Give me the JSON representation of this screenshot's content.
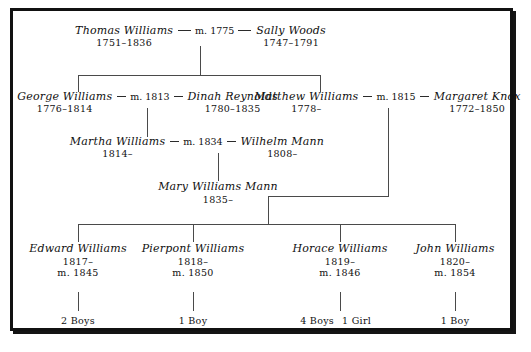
{
  "diagram": {
    "type": "genealogy-family-tree",
    "generations": [
      {
        "id": "gen1",
        "union": {
          "spouse_left": {
            "name": "Thomas Williams",
            "dates": "1751–1836"
          },
          "marriage": "m. 1775",
          "spouse_right": {
            "name": "Sally Woods",
            "dates": "1747–1791"
          }
        }
      },
      {
        "id": "gen2",
        "unions": [
          {
            "spouse_left": {
              "name": "George Williams",
              "dates": "1776–1814"
            },
            "marriage": "m. 1813",
            "spouse_right": {
              "name": "Dinah Reynolds",
              "dates": "1780–1835"
            }
          },
          {
            "spouse_left": {
              "name": "Matthew Williams",
              "dates": "1778–"
            },
            "marriage": "m. 1815",
            "spouse_right": {
              "name": "Margaret Knox",
              "dates": "1772–1850"
            }
          }
        ]
      },
      {
        "id": "gen3",
        "union": {
          "spouse_left": {
            "name": "Martha Williams",
            "dates": "1814–"
          },
          "marriage": "m. 1834",
          "spouse_right": {
            "name": "Wilhelm Mann",
            "dates": "1808–"
          }
        }
      },
      {
        "id": "gen4",
        "person": {
          "name": "Mary Williams Mann",
          "dates": "1835–"
        }
      },
      {
        "id": "gen5",
        "children": [
          {
            "name": "Edward Williams",
            "dates": "1817–",
            "marriage": "m. 1845",
            "offspring": "2 Boys",
            "offspring_extra": ""
          },
          {
            "name": "Pierpont Williams",
            "dates": "1818–",
            "marriage": "m. 1850",
            "offspring": "1 Boy",
            "offspring_extra": ""
          },
          {
            "name": "Horace Williams",
            "dates": "1819–",
            "marriage": "m. 1846",
            "offspring": "4 Boys",
            "offspring_extra": "1 Girl"
          },
          {
            "name": "John Williams",
            "dates": "1820–",
            "marriage": "m. 1854",
            "offspring": "1 Boy",
            "offspring_extra": ""
          }
        ]
      }
    ],
    "colors": {
      "ink": "#101010",
      "line": "#4a4a4a",
      "frame": "#111111",
      "background": "#ffffff"
    }
  }
}
